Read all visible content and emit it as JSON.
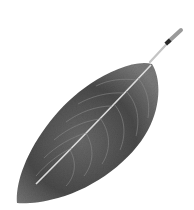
{
  "image": {
    "subject": "leaf",
    "description": "Grayscale photograph of a single elliptical leaf with a short petiole, oriented diagonally from lower-left tip to upper-right stem, on a white background",
    "colors": {
      "background": "#ffffff",
      "blade_dark": "#3a3a3a",
      "blade_mid": "#5e5e5e",
      "blade_light": "#8a8a8a",
      "midrib": "#d8d8d8",
      "stem": "#bfbfbf"
    }
  }
}
